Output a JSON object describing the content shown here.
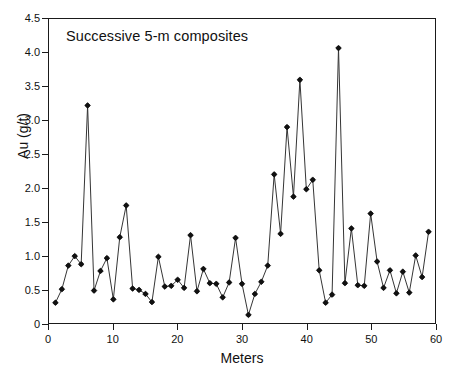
{
  "chart_data": {
    "type": "line",
    "title": "Successive 5-m composites",
    "xlabel": "Meters",
    "ylabel": "Au (g/t)",
    "xlim": [
      0,
      60
    ],
    "ylim": [
      0,
      4.5
    ],
    "xticks": [
      0,
      10,
      20,
      30,
      40,
      50,
      60
    ],
    "xticklabels": [
      "0",
      "10",
      "20",
      "30",
      "40",
      "50",
      "60"
    ],
    "yticks": [
      0,
      0.5,
      1.0,
      1.5,
      2.0,
      2.5,
      3.0,
      3.5,
      4.0,
      4.5
    ],
    "yticklabels": [
      "0",
      "0.5",
      "1.0",
      "1.5",
      "2.0",
      "2.5",
      "3.0",
      "3.5",
      "4.0",
      "4.5"
    ],
    "grid": false,
    "legend": false,
    "marker": "filled-diamond",
    "line_color": "#333333",
    "marker_color": "#111111",
    "axis_color": "#1a1a1a",
    "background": "#ffffff",
    "series": [
      {
        "name": "Au grade",
        "x": [
          1,
          2,
          3,
          4,
          5,
          6,
          7,
          8,
          9,
          10,
          11,
          12,
          13,
          14,
          15,
          16,
          17,
          18,
          19,
          20,
          21,
          22,
          23,
          24,
          25,
          26,
          27,
          28,
          29,
          30,
          31,
          32,
          33,
          34,
          35,
          36,
          37,
          38,
          39,
          40,
          41,
          42,
          43,
          44,
          45,
          46,
          47,
          48,
          49,
          50,
          51,
          52,
          53,
          54,
          55,
          56,
          57,
          58,
          59
        ],
        "values": [
          0.3,
          0.5,
          0.85,
          0.99,
          0.87,
          3.22,
          0.48,
          0.77,
          0.96,
          0.35,
          1.27,
          1.74,
          0.51,
          0.49,
          0.43,
          0.31,
          0.98,
          0.54,
          0.55,
          0.64,
          0.52,
          1.3,
          0.47,
          0.8,
          0.59,
          0.58,
          0.38,
          0.6,
          1.26,
          0.58,
          0.12,
          0.43,
          0.61,
          0.85,
          2.2,
          1.32,
          2.9,
          1.87,
          3.6,
          1.98,
          2.12,
          0.78,
          0.3,
          0.42,
          4.07,
          0.59,
          1.4,
          0.56,
          0.55,
          1.62,
          0.91,
          0.52,
          0.78,
          0.44,
          0.76,
          0.45,
          1.0,
          0.68,
          1.35
        ]
      }
    ]
  }
}
